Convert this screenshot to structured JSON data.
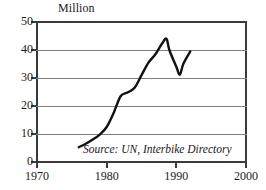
{
  "chart_data": {
    "type": "line",
    "title": "",
    "subtitle": "",
    "unit_label": "Million",
    "xlabel": "",
    "ylabel": "Million",
    "xlim": [
      1970,
      2000
    ],
    "ylim": [
      0,
      50
    ],
    "grid": true,
    "legend": null,
    "annotations": [
      {
        "name": "source",
        "text": "Source: UN, Interbike Directory"
      }
    ],
    "xticks": [
      1970,
      1980,
      1990,
      2000
    ],
    "xtick_labels": [
      "1970",
      "1980",
      "1990",
      "2000"
    ],
    "yticks": [
      0,
      10,
      20,
      30,
      40,
      50
    ],
    "ytick_labels": [
      "0",
      "10",
      "20",
      "30",
      "40",
      "50"
    ],
    "series": [
      {
        "name": "World bicycle production",
        "color": "#111111",
        "x": [
          1976,
          1977,
          1978,
          1979,
          1980,
          1981,
          1982,
          1983,
          1984,
          1985,
          1986,
          1987,
          1988,
          1988.6,
          1989,
          1990,
          1990.5,
          1991,
          1992
        ],
        "values": [
          5.3,
          6.5,
          8.0,
          9.8,
          12.5,
          17.5,
          23.5,
          24.8,
          26.5,
          31.0,
          35.5,
          38.5,
          42.5,
          44.0,
          40.0,
          34.0,
          31.2,
          35.0,
          39.5
        ]
      }
    ]
  },
  "colors": {
    "axis": "#3a3a3a",
    "grid": "#808080",
    "series": "#111111",
    "background": "#ffffff",
    "text": "#1a1a1a"
  }
}
